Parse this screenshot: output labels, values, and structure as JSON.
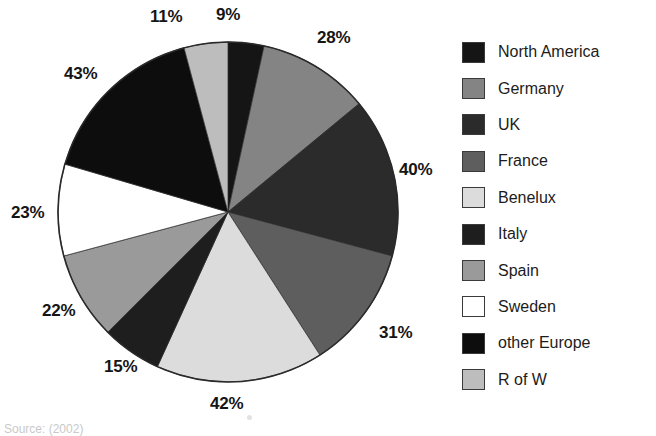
{
  "chart_data": {
    "type": "pie",
    "title": "",
    "subtitle": "",
    "xlabel": "",
    "ylabel": "",
    "legend_position": "right",
    "grid": false,
    "value_suffix": "%",
    "start_angle_deg": 0,
    "direction": "clockwise",
    "categories": [
      "North America",
      "Germany",
      "UK",
      "France",
      "Benelux",
      "Italy",
      "Spain",
      "Sweden",
      "other Europe",
      "R of W"
    ],
    "values": [
      9,
      28,
      40,
      31,
      42,
      15,
      22,
      23,
      43,
      11
    ],
    "labels": [
      "9%",
      "28%",
      "40%",
      "31%",
      "42%",
      "15%",
      "22%",
      "23%",
      "43%",
      "11%"
    ],
    "colors": [
      "#151515",
      "#848484",
      "#2b2b2b",
      "#5e5e5e",
      "#dcdcdc",
      "#1e1e1e",
      "#9a9a9a",
      "#ffffff",
      "#0d0d0d",
      "#bdbdbd"
    ],
    "total": 264,
    "slices": [
      {
        "name": "North America",
        "value": 9,
        "label": "9%",
        "color": "#151515",
        "start_deg": 0.0,
        "end_deg": 12.273
      },
      {
        "name": "Germany",
        "value": 28,
        "label": "28%",
        "color": "#848484",
        "start_deg": 12.273,
        "end_deg": 50.455
      },
      {
        "name": "UK",
        "value": 40,
        "label": "40%",
        "color": "#2b2b2b",
        "start_deg": 50.455,
        "end_deg": 105.0
      },
      {
        "name": "France",
        "value": 31,
        "label": "31%",
        "color": "#5e5e5e",
        "start_deg": 105.0,
        "end_deg": 147.273
      },
      {
        "name": "Benelux",
        "value": 42,
        "label": "42%",
        "color": "#dcdcdc",
        "start_deg": 147.273,
        "end_deg": 204.545
      },
      {
        "name": "Italy",
        "value": 15,
        "label": "15%",
        "color": "#1e1e1e",
        "start_deg": 204.545,
        "end_deg": 225.0
      },
      {
        "name": "Spain",
        "value": 22,
        "label": "22%",
        "color": "#9a9a9a",
        "start_deg": 225.0,
        "end_deg": 255.0
      },
      {
        "name": "Sweden",
        "value": 23,
        "label": "23%",
        "color": "#ffffff",
        "start_deg": 255.0,
        "end_deg": 286.364
      },
      {
        "name": "other Europe",
        "value": 43,
        "label": "43%",
        "color": "#0d0d0d",
        "start_deg": 286.364,
        "end_deg": 345.0
      },
      {
        "name": "R of W",
        "value": 11,
        "label": "11%",
        "color": "#bdbdbd",
        "start_deg": 345.0,
        "end_deg": 360.0
      }
    ]
  },
  "legend": {
    "items": [
      {
        "label": "North America",
        "color": "#151515"
      },
      {
        "label": "Germany",
        "color": "#848484"
      },
      {
        "label": "UK",
        "color": "#2b2b2b"
      },
      {
        "label": "France",
        "color": "#5e5e5e"
      },
      {
        "label": "Benelux",
        "color": "#dcdcdc"
      },
      {
        "label": "Italy",
        "color": "#1e1e1e"
      },
      {
        "label": "Spain",
        "color": "#9a9a9a"
      },
      {
        "label": "Sweden",
        "color": "#ffffff"
      },
      {
        "label": "other Europe",
        "color": "#0d0d0d"
      },
      {
        "label": "R of W",
        "color": "#bdbdbd"
      }
    ]
  },
  "pct_labels": [
    {
      "text": "11%",
      "x": 150,
      "y": 8
    },
    {
      "text": "9%",
      "x": 216,
      "y": 6
    },
    {
      "text": "28%",
      "x": 317,
      "y": 29
    },
    {
      "text": "40%",
      "x": 399,
      "y": 161
    },
    {
      "text": "31%",
      "x": 379,
      "y": 324
    },
    {
      "text": "42%",
      "x": 210,
      "y": 395
    },
    {
      "text": "15%",
      "x": 104,
      "y": 358
    },
    {
      "text": "22%",
      "x": 42,
      "y": 302
    },
    {
      "text": "23%",
      "x": 11,
      "y": 204
    },
    {
      "text": "43%",
      "x": 64,
      "y": 65
    }
  ],
  "source_note": {
    "text": "Source: (2002)"
  }
}
